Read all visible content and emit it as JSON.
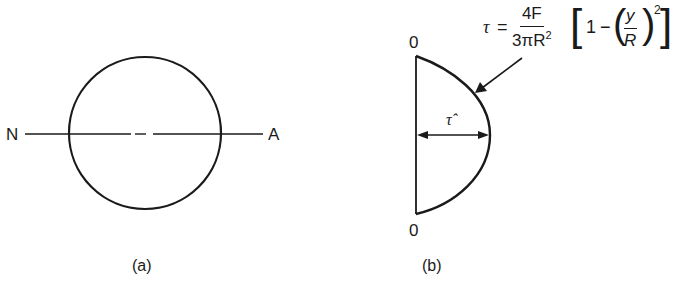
{
  "figure_a": {
    "left_axis_label": "N",
    "right_axis_label": "A",
    "caption": "(a)"
  },
  "figure_b": {
    "top_label": "0",
    "bottom_label": "0",
    "max_stress_label": "τ̂",
    "caption": "(b)",
    "formula": {
      "lhs": "τ",
      "equals": "=",
      "numerator": "4F",
      "denominator_prefix": "3π",
      "denominator_var": "R",
      "denominator_exp": "2",
      "bracket_open": "[",
      "one": "1",
      "minus": "−",
      "paren_open": "(",
      "inner_num": "y",
      "inner_den": "R",
      "paren_close": ")",
      "exponent": "2",
      "bracket_close": "]"
    }
  },
  "colors": {
    "ink": "#1a1a1a",
    "background": "#ffffff"
  }
}
